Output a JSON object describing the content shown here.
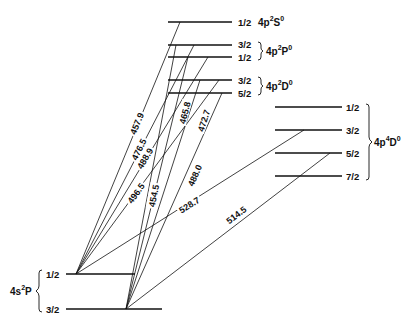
{
  "diagram": {
    "type": "energy-level-diagram",
    "upper_terms": [
      {
        "id": "4p2S0",
        "config": "4p",
        "mult": "2",
        "L": "S",
        "parity": "0",
        "levels": [
          {
            "J": "1/2",
            "y": 22
          }
        ],
        "x1": 168,
        "x2": 232
      },
      {
        "id": "4p2P0",
        "config": "4p",
        "mult": "2",
        "L": "P",
        "parity": "0",
        "levels": [
          {
            "J": "3/2",
            "y": 45
          },
          {
            "J": "1/2",
            "y": 57
          }
        ],
        "x1": 168,
        "x2": 232
      },
      {
        "id": "4p2D0",
        "config": "4p",
        "mult": "2",
        "L": "D",
        "parity": "0",
        "levels": [
          {
            "J": "3/2",
            "y": 80
          },
          {
            "J": "5/2",
            "y": 93
          }
        ],
        "x1": 168,
        "x2": 232
      },
      {
        "id": "4p4D0",
        "config": "4p",
        "mult": "4",
        "L": "D",
        "parity": "0",
        "levels": [
          {
            "J": "1/2",
            "y": 107
          },
          {
            "J": "3/2",
            "y": 130
          },
          {
            "J": "5/2",
            "y": 153
          },
          {
            "J": "7/2",
            "y": 176
          }
        ],
        "x1": 275,
        "x2": 358
      }
    ],
    "lower_term": {
      "id": "4s2P",
      "config": "4s",
      "mult": "2",
      "L": "P",
      "levels": [
        {
          "J": "1/2",
          "y": 274,
          "x1": 66,
          "x2": 135
        },
        {
          "J": "3/2",
          "y": 309,
          "x1": 66,
          "x2": 162
        }
      ]
    },
    "transitions": [
      {
        "wavelength": "457.9",
        "upper": "4p2S0 1/2",
        "lower": "4s2P 1/2",
        "x1": 180,
        "y1": 22,
        "x2": 76,
        "y2": 274
      },
      {
        "wavelength": "476.5",
        "upper": "4p2P0 3/2",
        "lower": "4s2P 1/2",
        "x1": 194,
        "y1": 45,
        "x2": 76,
        "y2": 274
      },
      {
        "wavelength": "488.9",
        "upper": "4p2P0 1/2",
        "lower": "4s2P 1/2",
        "x1": 208,
        "y1": 57,
        "x2": 76,
        "y2": 274
      },
      {
        "wavelength": "496.5",
        "upper": "4p2D0 3/2",
        "lower": "4s2P 1/2",
        "x1": 219,
        "y1": 80,
        "x2": 76,
        "y2": 274
      },
      {
        "wavelength": "465.8",
        "upper": "4p2P0 1/2",
        "lower": "4s2P 3/2",
        "x1": 188,
        "y1": 57,
        "x2": 126,
        "y2": 309
      },
      {
        "wavelength": "454.5",
        "upper": "4p2P0 3/2",
        "lower": "4s2P 3/2",
        "x1": 176,
        "y1": 45,
        "x2": 126,
        "y2": 309
      },
      {
        "wavelength": "472.7",
        "upper": "4p2D0 3/2",
        "lower": "4s2P 3/2",
        "x1": 200,
        "y1": 80,
        "x2": 126,
        "y2": 309
      },
      {
        "wavelength": "488.0",
        "upper": "4p2D0 5/2",
        "lower": "4s2P 3/2",
        "x1": 222,
        "y1": 93,
        "x2": 126,
        "y2": 309
      },
      {
        "wavelength": "528.7",
        "upper": "4p4D0 3/2",
        "lower": "4s2P 1/2",
        "x1": 304,
        "y1": 130,
        "x2": 76,
        "y2": 274
      },
      {
        "wavelength": "514.5",
        "upper": "4p4D0 5/2",
        "lower": "4s2P 3/2",
        "x1": 330,
        "y1": 153,
        "x2": 126,
        "y2": 309
      }
    ],
    "labels": {
      "t_2S": "4p",
      "t_2P": "4p",
      "t_2D": "4p",
      "t_4D": "4p",
      "t_lower": "4s",
      "j_2S_1": "1/2",
      "j_2P_1": "3/2",
      "j_2P_2": "1/2",
      "j_2D_1": "3/2",
      "j_2D_2": "5/2",
      "j_4D_1": "1/2",
      "j_4D_2": "3/2",
      "j_4D_3": "5/2",
      "j_4D_4": "7/2",
      "j_low_1": "1/2",
      "j_low_2": "3/2",
      "sup2": "2",
      "sup4": "4",
      "sup0": "0",
      "S": "S",
      "P": "P",
      "D": "D",
      "w4579": "457.9",
      "w4765": "476.5",
      "w4889": "488.9",
      "w4965": "496.5",
      "w4658": "465.8",
      "w4545": "454.5",
      "w4727": "472.7",
      "w4880": "488.0",
      "w5287": "528.7",
      "w5145": "514.5"
    }
  }
}
